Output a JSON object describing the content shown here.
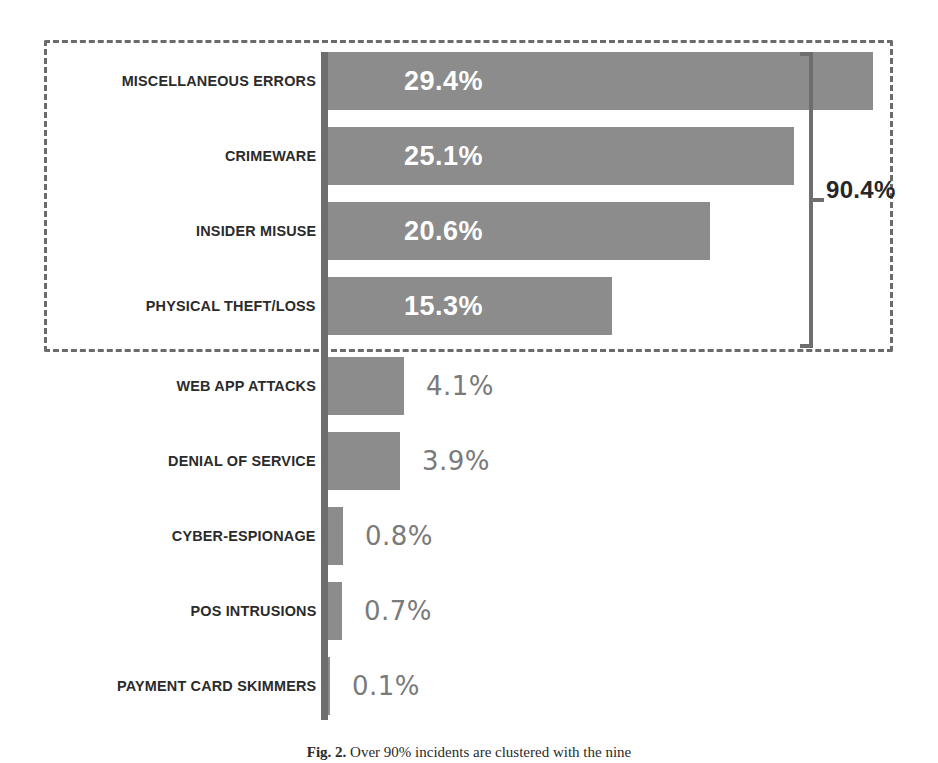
{
  "figure": {
    "caption_prefix": "Fig. 2.",
    "caption_text": "Over 90% incidents are clustered with the nine",
    "bracket_label": "90.4%",
    "accent_gray": "#8c8c8c",
    "axis_gray": "#6e6e6e",
    "dash_gray": "#6b6b6b",
    "in_bar_label_color": "#ffffff",
    "out_bar_label_color": "#7a7a7a"
  },
  "chart_data": {
    "type": "bar",
    "orientation": "horizontal",
    "title": "",
    "subtitle": "",
    "xlabel": "",
    "ylabel": "",
    "xlim": [
      0,
      30
    ],
    "grid": false,
    "legend": "none",
    "categories": [
      "MISCELLANEOUS ERRORS",
      "CRIMEWARE",
      "INSIDER MISUSE",
      "PHYSICAL THEFT/LOSS",
      "WEB APP ATTACKS",
      "DENIAL OF SERVICE",
      "CYBER-ESPIONAGE",
      "POS INTRUSIONS",
      "PAYMENT CARD SKIMMERS"
    ],
    "values": [
      29.4,
      25.1,
      20.6,
      15.3,
      4.1,
      3.9,
      0.8,
      0.7,
      0.1
    ],
    "value_labels": [
      "29.4%",
      "25.1%",
      "20.6%",
      "15.3%",
      "4.1%",
      "3.9%",
      "0.8%",
      "0.7%",
      "0.1%"
    ],
    "label_placement": [
      "inside",
      "inside",
      "inside",
      "inside",
      "outside",
      "outside",
      "outside",
      "outside",
      "outside"
    ],
    "annotations": [
      {
        "text": "90.4%",
        "kind": "bracket",
        "covers_categories": [
          "MISCELLANEOUS ERRORS",
          "CRIMEWARE",
          "INSIDER MISUSE",
          "PHYSICAL THEFT/LOSS"
        ]
      },
      {
        "text": "",
        "kind": "dashed-box",
        "covers_categories": [
          "MISCELLANEOUS ERRORS",
          "CRIMEWARE",
          "INSIDER MISUSE",
          "PHYSICAL THEFT/LOSS"
        ]
      }
    ]
  },
  "rows": [
    {
      "label": "MISCELLANEOUS ERRORS",
      "value_label": "29.4%",
      "top": 52,
      "width": 545,
      "inside": true
    },
    {
      "label": "CRIMEWARE",
      "value_label": "25.1%",
      "top": 127,
      "width": 466,
      "inside": true
    },
    {
      "label": "INSIDER MISUSE",
      "value_label": "20.6%",
      "top": 202,
      "width": 382,
      "inside": true
    },
    {
      "label": "PHYSICAL THEFT/LOSS",
      "value_label": "15.3%",
      "top": 277,
      "width": 284,
      "inside": true
    },
    {
      "label": "WEB APP ATTACKS",
      "value_label": "4.1%",
      "top": 357,
      "width": 76,
      "inside": false
    },
    {
      "label": "DENIAL OF SERVICE",
      "value_label": "3.9%",
      "top": 432,
      "width": 72,
      "inside": false
    },
    {
      "label": "CYBER-ESPIONAGE",
      "value_label": "0.8%",
      "top": 507,
      "width": 15,
      "inside": false
    },
    {
      "label": "POS INTRUSIONS",
      "value_label": "0.7%",
      "top": 582,
      "width": 14,
      "inside": false
    },
    {
      "label": "PAYMENT CARD SKIMMERS",
      "value_label": "0.1%",
      "top": 657,
      "width": 2,
      "inside": false
    }
  ]
}
